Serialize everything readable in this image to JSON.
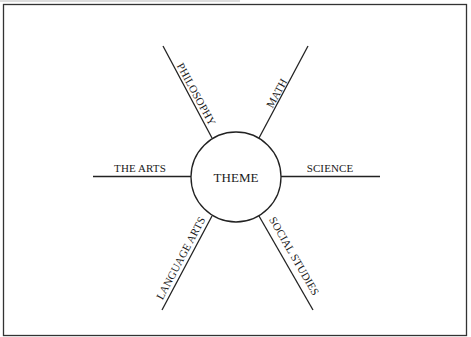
{
  "diagram": {
    "type": "web-organizer",
    "center": {
      "label": "THEME"
    },
    "spokes": [
      {
        "id": "philosophy",
        "label": "PHILOSOPHY",
        "position": "upper-left"
      },
      {
        "id": "math",
        "label": "MATH",
        "position": "upper-right"
      },
      {
        "id": "the-arts",
        "label": "THE ARTS",
        "position": "left"
      },
      {
        "id": "science",
        "label": "SCIENCE",
        "position": "right"
      },
      {
        "id": "language-arts",
        "label": "LANGUAGE ARTS",
        "position": "lower-left"
      },
      {
        "id": "social-studies",
        "label": "SOCIAL STUDIES",
        "position": "lower-right"
      }
    ]
  },
  "colors": {
    "line": "#222222",
    "text": "#1a1a1a",
    "background": "#ffffff"
  }
}
